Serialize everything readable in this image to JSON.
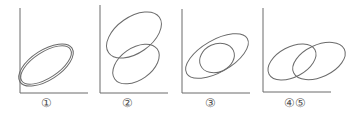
{
  "figure": {
    "panels": [
      {
        "label": "①",
        "description": "two concentric, nearly identical ellipses tilted positively"
      },
      {
        "label": "②",
        "description": "two ellipses stacked vertically, overlapping slightly"
      },
      {
        "label": "③",
        "description": "a large ellipse containing a smaller overlapping ellipse"
      },
      {
        "label": "④⑤",
        "description": "two ellipses side by side, overlapping horizontally"
      }
    ],
    "stroke_color": "#6b6b6b"
  }
}
